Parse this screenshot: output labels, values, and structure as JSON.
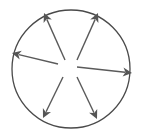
{
  "diagram": {
    "colors": {
      "background": "#ffffff",
      "circle_stroke": "#4a4a4a",
      "arrow": "#555555"
    },
    "arrows": [
      {
        "name": "arrow-up-left",
        "direction": "up-left"
      },
      {
        "name": "arrow-up-right",
        "direction": "up-right"
      },
      {
        "name": "arrow-left",
        "direction": "left"
      },
      {
        "name": "arrow-right",
        "direction": "right"
      },
      {
        "name": "arrow-down-left",
        "direction": "down-left"
      },
      {
        "name": "arrow-down-right",
        "direction": "down-right"
      }
    ]
  }
}
